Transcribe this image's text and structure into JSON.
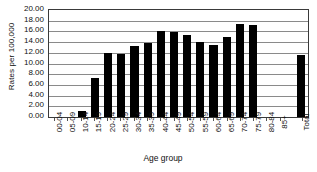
{
  "chart_data": {
    "type": "bar",
    "title": "",
    "xlabel": "Age group",
    "ylabel": "Rates per 100,000",
    "ylim": [
      0,
      20
    ],
    "grid": true,
    "legend": "none",
    "ytick_labels": [
      "20.00",
      "18.00",
      "16.00",
      "14.00",
      "12.00",
      "10.00",
      "8.00",
      "6.00",
      "4.00",
      "2.00",
      "0.00"
    ],
    "ytick_values": [
      20,
      18,
      16,
      14,
      12,
      10,
      8,
      6,
      4,
      2,
      0
    ],
    "categories": [
      "00-04",
      "05-09",
      "10-14",
      "15-19",
      "20-24",
      "25-29",
      "30-34",
      "35-39",
      "40-44",
      "45-49",
      "50-54",
      "55-59",
      "60-64",
      "65-69",
      "70-74",
      "75-79",
      "80-84",
      "85+",
      "Total"
    ],
    "values": [
      0.0,
      0.0,
      1.15,
      7.2,
      11.9,
      11.85,
      13.35,
      13.9,
      16.0,
      15.95,
      15.3,
      14.0,
      13.4,
      14.9,
      17.4,
      17.2,
      0.0,
      0.0,
      11.6
    ],
    "bars": [
      {
        "category": "00-04",
        "value": 0.0
      },
      {
        "category": "05-09",
        "value": 0.0
      },
      {
        "category": "10-14",
        "value": 1.15
      },
      {
        "category": "15-19",
        "value": 7.2
      },
      {
        "category": "20-24",
        "value": 11.9
      },
      {
        "category": "25-29",
        "value": 11.85
      },
      {
        "category": "30-34",
        "value": 13.35
      },
      {
        "category": "35-39",
        "value": 13.9
      },
      {
        "category": "40-44",
        "value": 16.0
      },
      {
        "category": "45-49",
        "value": 15.95
      },
      {
        "category": "50-54",
        "value": 15.3
      },
      {
        "category": "55-59",
        "value": 14.0
      },
      {
        "category": "60-64",
        "value": 13.4
      },
      {
        "category": "65-69",
        "value": 14.9
      },
      {
        "category": "70-74",
        "value": 17.4
      },
      {
        "category": "75-79",
        "value": 17.2
      },
      {
        "category": "80-84",
        "value": 0.0
      },
      {
        "category": "85+",
        "value": 0.0
      },
      {
        "category": "Total",
        "value": 11.6
      }
    ],
    "separator_before": "Total",
    "colors": {
      "bar": "#000000",
      "gridline": "#8a8a8a",
      "frame": "#3a3a3a",
      "background": "#ffffff",
      "text": "#111111"
    }
  }
}
